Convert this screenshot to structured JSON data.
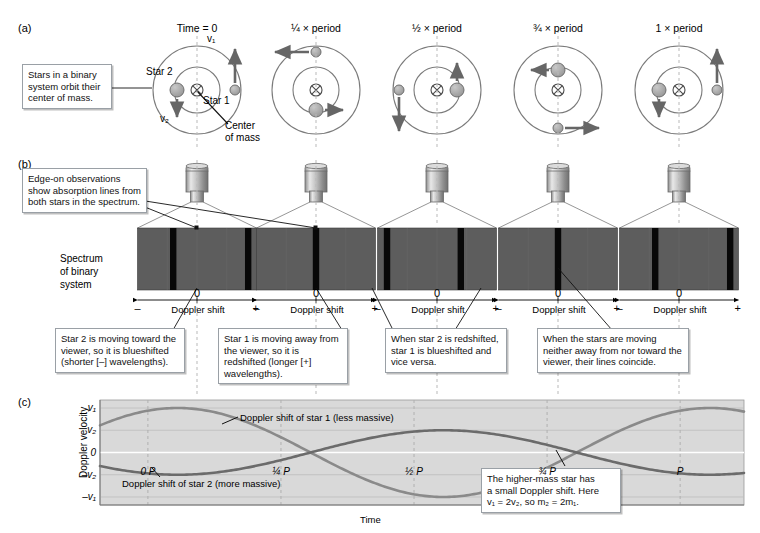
{
  "panels": {
    "a": "(a)",
    "b": "(b)",
    "c": "(c)"
  },
  "callouts": {
    "orbit_note": "Stars in a binary system orbit their center of mass.",
    "edge_on_note": "Edge-on observations show absorption lines from both stars in the spectrum.",
    "star2_blue": "Star 2 is moving toward the viewer, so it is blueshifted (shorter [–] wavelengths).",
    "star1_red": "Star 1 is moving away from the viewer, so it is redshifted (longer [+] wavelengths).",
    "swap_note": "When star 2 is redshifted, star 1 is blueshifted and vice versa.",
    "coincide_note": "When the stars are moving neither away from nor toward the viewer, their lines coincide.",
    "mass_note_line1": "The higher-mass star has",
    "mass_note_line2": "a small Doppler shift. Here",
    "mass_note_line3": "v₁ = 2v₂, so m₂ = 2m₁."
  },
  "orbit": {
    "labels": {
      "star1": "Star 1",
      "star2": "Star 2",
      "v1": "v₁",
      "v2": "v₂",
      "center_of_mass_line1": "Center",
      "center_of_mass_line2": "of mass"
    },
    "time_labels": [
      "Time = 0",
      "¼ × period",
      "½ × period",
      "¾ × period",
      "1 × period"
    ],
    "frames": [
      {
        "name": "time-0",
        "star1": {
          "x": 38,
          "y": 0,
          "vx": 0,
          "vy": -1,
          "len": 34
        },
        "star2": {
          "x": -20,
          "y": 0,
          "vx": 0,
          "vy": 1,
          "len": 18
        }
      },
      {
        "name": "quarter-period",
        "star1": {
          "x": 0,
          "y": -38,
          "vx": -1,
          "vy": 0,
          "len": 34
        },
        "star2": {
          "x": 0,
          "y": 20,
          "vx": 1,
          "vy": 0,
          "len": 18
        }
      },
      {
        "name": "half-period",
        "star1": {
          "x": -38,
          "y": 0,
          "vx": 0,
          "vy": 1,
          "len": 34
        },
        "star2": {
          "x": 20,
          "y": 0,
          "vx": 0,
          "vy": -1,
          "len": 18
        }
      },
      {
        "name": "three-quarter",
        "star1": {
          "x": 0,
          "y": 38,
          "vx": 1,
          "vy": 0,
          "len": 34
        },
        "star2": {
          "x": 0,
          "y": -20,
          "vx": -1,
          "vy": 0,
          "len": 18
        }
      },
      {
        "name": "one-period",
        "star1": {
          "x": 38,
          "y": 0,
          "vx": 0,
          "vy": -1,
          "len": 34
        },
        "star2": {
          "x": -20,
          "y": 0,
          "vx": 0,
          "vy": 1,
          "len": 18
        }
      }
    ]
  },
  "spectrum": {
    "title_line1": "Spectrum",
    "title_line2": "of binary",
    "title_line3": "system",
    "axis_label": "Doppler shift",
    "minus": "–",
    "zero": "0",
    "plus": "+",
    "background_color": "#5d5d5d",
    "line_color": "#080808",
    "panels": [
      {
        "name": "spectrum-time-0",
        "lines": [
          30,
          93
        ]
      },
      {
        "name": "spectrum-quarter",
        "lines": [
          50
        ]
      },
      {
        "name": "spectrum-half",
        "lines": [
          8,
          70
        ]
      },
      {
        "name": "spectrum-three-quarter",
        "lines": [
          50
        ]
      },
      {
        "name": "spectrum-one-period",
        "lines": [
          30,
          93
        ]
      }
    ]
  },
  "chart_data": {
    "type": "line",
    "title": "",
    "xlabel": "Time",
    "ylabel": "Doppler velocity",
    "x_tick_labels": [
      "0 P",
      "¼ P",
      "½ P",
      "¾ P",
      "P"
    ],
    "x_tick_positions": [
      0,
      0.25,
      0.5,
      0.75,
      1.0
    ],
    "y_tick_labels": [
      "v₁",
      "v₂",
      "0",
      "–v₂",
      "–v₁"
    ],
    "y_tick_values": [
      1,
      0.5,
      0,
      -0.5,
      -1
    ],
    "ylim": [
      -1.18,
      1.18
    ],
    "xlim": [
      -0.09,
      1.12
    ],
    "grid": true,
    "legend_position": "inline-annotation",
    "series": [
      {
        "name": "Doppler shift of star 1 (less massive)",
        "label": "Doppler shift of star 1 (less massive)",
        "amplitude": 1.0,
        "phase_deg": 70,
        "color": "#8a8a8a",
        "values_at_ticks": [
          0.94,
          0.0,
          -1.0,
          0.0,
          0.94
        ]
      },
      {
        "name": "Doppler shift of star 2 (more massive)",
        "label": "Doppler shift of star 2 (more massive)",
        "amplitude": 0.5,
        "phase_deg": 250,
        "color": "#6b6b6b",
        "values_at_ticks": [
          -0.47,
          0.0,
          0.5,
          0.0,
          -0.47
        ]
      }
    ],
    "plot_background": "#d9d9d9"
  }
}
